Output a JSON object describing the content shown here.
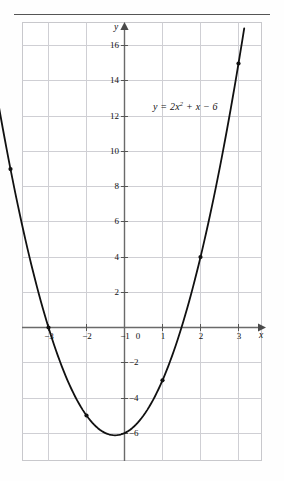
{
  "figure": {
    "equation_label": {
      "base": "y = 2x",
      "exponent": "2",
      "tail": " + x − 6"
    },
    "axis_labels": {
      "x": "x",
      "y": "y"
    },
    "x_tick_labels": [
      "−3",
      "−2",
      "−1",
      "0",
      "1",
      "2",
      "3"
    ],
    "y_tick_labels": [
      "16",
      "14",
      "12",
      "10",
      "8",
      "6",
      "4",
      "2",
      "−2",
      "−4",
      "−6"
    ],
    "colors": {
      "curve": "#111111",
      "axis": "#6a6a6a",
      "grid": "#cfcfd4",
      "frame": "#c8c8cc",
      "text": "#111111",
      "rule": "#555555"
    }
  },
  "chart_data": {
    "type": "line",
    "title": "",
    "subtitle": "",
    "annotation": "y = 2x² + x − 6",
    "function": "y = 2x^2 + x - 6",
    "xlabel": "x",
    "ylabel": "y",
    "xlim": [
      -3.4,
      3.4
    ],
    "ylim": [
      -7.2,
      17.2
    ],
    "xticks": [
      -3,
      -2,
      -1,
      0,
      1,
      2,
      3
    ],
    "yticks": [
      16,
      14,
      12,
      10,
      8,
      6,
      4,
      2,
      -2,
      -4,
      -6
    ],
    "grid": true,
    "legend": "none",
    "series": [
      {
        "name": "y = 2x^2 + x - 6",
        "x": [
          -3,
          -2,
          -1,
          0,
          1,
          2,
          3
        ],
        "y": [
          9,
          0,
          -5,
          -6,
          -3,
          4,
          15
        ]
      }
    ],
    "marked_points": [
      {
        "x": -3,
        "y": 9
      },
      {
        "x": -2,
        "y": 0
      },
      {
        "x": -1,
        "y": -5
      },
      {
        "x": 1,
        "y": -3
      },
      {
        "x": 2,
        "y": 4
      },
      {
        "x": 3,
        "y": 15
      }
    ],
    "vertex": {
      "x": -0.25,
      "y": -6.125
    },
    "roots": [
      -2,
      1.5
    ]
  }
}
